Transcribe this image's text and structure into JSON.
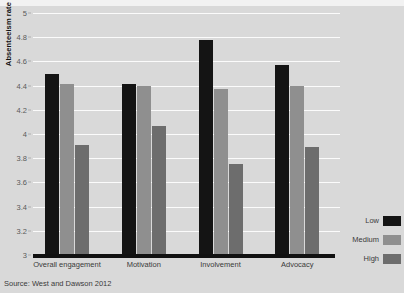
{
  "chart_data": {
    "type": "bar",
    "title": "",
    "xlabel": "",
    "ylabel": "Absenteeism rate (%)",
    "ylim": [
      3,
      5
    ],
    "yticks": [
      "3",
      "3.2",
      "3.4",
      "3.6",
      "3.8",
      "4",
      "4.2",
      "4.4",
      "4.6",
      "4.8",
      "5"
    ],
    "ytick_values": [
      3,
      3.2,
      3.4,
      3.6,
      3.8,
      4,
      4.2,
      4.4,
      4.6,
      4.8,
      5
    ],
    "grid": true,
    "legend_position": "right",
    "categories": [
      "Overall engagement",
      "Motivation",
      "Involvement",
      "Advocacy"
    ],
    "series": [
      {
        "name": "Low",
        "color": "#141414",
        "values": [
          4.5,
          4.41,
          4.78,
          4.57
        ]
      },
      {
        "name": "Medium",
        "color": "#8f8f8f",
        "values": [
          4.41,
          4.4,
          4.37,
          4.4
        ]
      },
      {
        "name": "High",
        "color": "#6d6d6d",
        "values": [
          3.91,
          4.07,
          3.75,
          3.89
        ]
      }
    ],
    "source": "Source: West and Dawson 2012"
  },
  "colors": {
    "background": "#d9d9d9",
    "gridline": "#fbfbfb",
    "axis": "#111111",
    "tick_text": "#5a5a5a",
    "label_text": "#3a3a3a"
  }
}
